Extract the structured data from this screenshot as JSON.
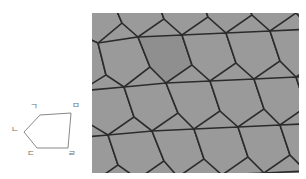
{
  "figure": {
    "background_color": "#ffffff",
    "title": "",
    "panels": [
      {
        "id": "pentagon-diagram",
        "name": "labelled-pentagon"
      },
      {
        "id": "tiling-diagram",
        "name": "pentagonal-tiling"
      }
    ]
  },
  "pentagon": {
    "name": "labelled-pentagon",
    "stroke_color": "#7a7a7a",
    "fill_color": "#ffffff",
    "stroke_width": 0.9,
    "vertices": [
      {
        "label": "ㄱ",
        "x": 40,
        "y": 27,
        "label_x": 34,
        "label_y": 21
      },
      {
        "label": "ㅁ",
        "x": 71,
        "y": 25,
        "label_x": 76,
        "label_y": 20
      },
      {
        "label": "ㄹ",
        "x": 68,
        "y": 60,
        "label_x": 72,
        "label_y": 68
      },
      {
        "label": "ㄷ",
        "x": 37,
        "y": 60,
        "label_x": 31,
        "label_y": 68
      },
      {
        "label": "ㄴ",
        "x": 24,
        "y": 44,
        "label_x": 15,
        "label_y": 44
      }
    ],
    "path": "M40,27 L71,25 L68,60 L37,60 L24,44 Z",
    "labels": [
      "ㄱ",
      "ㅁ",
      "ㄹ",
      "ㄷ",
      "ㄴ"
    ]
  },
  "tiling": {
    "name": "pentagonal-tiling",
    "tile_fill": "#9a9a9a",
    "tile_fill_alt": "#8f8f8f",
    "edge_color": "#2b2b2b",
    "edge_width": 1.6,
    "clip": {
      "x": 0,
      "y": 0,
      "width": 207,
      "height": 160
    },
    "tile_count": 30,
    "description": "tessellation of congruent pentagons",
    "paths": [
      "M-18,-12 L18,-18 L30,10 L6,30 L-22,18 Z",
      "M18,-18 L62,-22 L72,6 L46,24 L30,10 Z",
      "M62,-22 L106,-24 L116,4 L90,22 L72,6 Z",
      "M106,-24 L150,-26 L160,2 L134,20 L116,4 Z",
      "M150,-26 L194,-28 L204,0 L178,18 L160,2 Z",
      "M194,-28 L236,-30 L246,-2 L220,16 L204,0 Z",
      "M-22,18 L6,30 L14,62 L-12,78 L-34,58 Z",
      "M6,30 L46,24 L58,54 L32,74 L14,62 Z",
      "M46,24 L90,22 L100,52 L74,70 L58,54 Z",
      "M90,22 L134,20 L144,50 L118,68 L100,52 Z",
      "M134,20 L178,18 L188,48 L162,66 L144,50 Z",
      "M178,18 L220,16 L230,46 L204,64 L188,48 Z",
      "M-34,58 L-12,78 L-4,110 L-30,126 L-50,104 Z",
      "M-12,78 L32,74 L42,104 L16,122 L-4,110 Z",
      "M32,74 L74,70 L86,100 L60,118 L42,104 Z",
      "M74,70 L118,68 L128,98 L102,116 L86,100 Z",
      "M118,68 L162,66 L172,96 L146,114 L128,98 Z",
      "M162,66 L204,64 L214,94 L188,112 L172,96 Z",
      "M204,64 L246,62 L256,92 L230,110 L214,94 Z",
      "M-50,104 L-30,126 L-22,158 L-48,174 L-66,150 Z",
      "M-30,126 L16,122 L26,152 L0,170 L-22,158 Z",
      "M16,122 L60,118 L72,148 L46,166 L26,152 Z",
      "M60,118 L102,116 L112,146 L86,164 L72,148 Z",
      "M102,116 L146,114 L156,144 L130,162 L112,146 Z",
      "M146,114 L188,112 L198,142 L172,160 L156,144 Z",
      "M188,112 L230,110 L240,140 L214,158 L198,142 Z",
      "M-48,174 L0,170 L10,200 L-16,218 L-38,204 Z",
      "M0,170 L46,166 L56,196 L30,214 L10,200 Z",
      "M46,166 L86,164 L98,194 L72,212 L56,196 Z",
      "M86,164 L130,162 L140,192 L114,210 L98,194 Z",
      "M130,162 L172,160 L182,190 L156,208 L140,192 Z",
      "M172,160 L214,158 L224,188 L198,206 L182,190 Z"
    ]
  }
}
